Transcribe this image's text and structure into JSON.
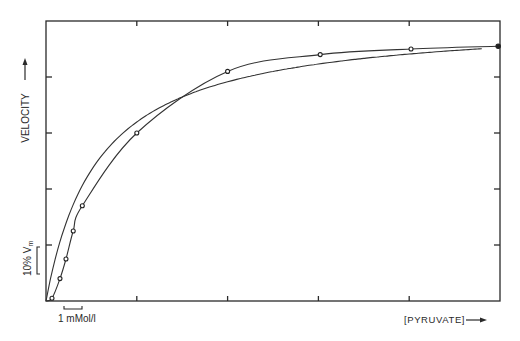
{
  "chart_data": {
    "type": "line",
    "title": "",
    "xlabel": "[PYRUVATE]",
    "ylabel": "VELOCITY",
    "xlim": [
      0,
      25
    ],
    "ylim": [
      0,
      100
    ],
    "x_unit": "mMol/l",
    "y_unit": "% Vm",
    "x_ticks": [
      5,
      10,
      15,
      20
    ],
    "y_ticks": [
      20,
      40,
      60,
      80
    ],
    "grid": false,
    "legend": null,
    "annotations": [
      {
        "text": "10% Vm",
        "type": "scale-bar",
        "axis": "y",
        "span": [
          10,
          20
        ]
      },
      {
        "text": "1 mMol/l",
        "type": "scale-bar",
        "axis": "x",
        "span": [
          1,
          2
        ]
      }
    ],
    "series": [
      {
        "name": "measured (sigmoidal)",
        "marker": "open-circle",
        "x": [
          0.33,
          0.77,
          1.1,
          1.5,
          2.0,
          5.0,
          10.0,
          15.1,
          20.1,
          24.9
        ],
        "y": [
          1,
          8,
          15,
          25,
          34,
          60,
          82,
          88,
          90,
          91
        ]
      },
      {
        "name": "hyperbolic (Michaelis-Menten)",
        "marker": "none",
        "x": [
          0,
          1.1,
          1.9,
          4.6,
          7.4,
          10.0,
          15.1,
          24.0
        ],
        "y": [
          0,
          25,
          40,
          60,
          72,
          79,
          85,
          90
        ]
      }
    ]
  },
  "labels": {
    "y_axis": "VELOCITY",
    "y_arrow": "→",
    "x_axis": "[PYRUVATE]",
    "x_arrow": "→",
    "y_scale": "10% V",
    "y_scale_sub": "m",
    "x_scale": "1 mMol/l"
  }
}
